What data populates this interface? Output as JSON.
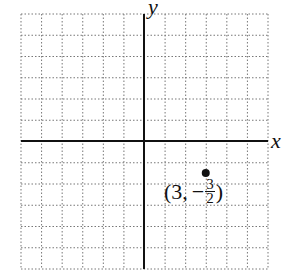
{
  "diagram": {
    "type": "coordinate-plane",
    "x_axis_label": "x",
    "y_axis_label": "y",
    "grid": {
      "x_min": -6,
      "x_max": 6,
      "y_min": -6,
      "y_max": 6,
      "step": 1,
      "style": "dotted"
    },
    "point": {
      "x": 3,
      "y": -1.5
    },
    "point_label": {
      "open": "(",
      "x": "3",
      "sep": ",",
      "sign": "−",
      "numerator": "3",
      "denominator": "2",
      "close": ")"
    }
  },
  "chart_data": {
    "type": "scatter",
    "title": "",
    "xlabel": "x",
    "ylabel": "y",
    "xlim": [
      -6,
      6
    ],
    "ylim": [
      -6,
      6
    ],
    "grid": true,
    "series": [
      {
        "name": "point",
        "x": [
          3
        ],
        "y": [
          -1.5
        ],
        "labels": [
          "(3, -3/2)"
        ]
      }
    ]
  }
}
